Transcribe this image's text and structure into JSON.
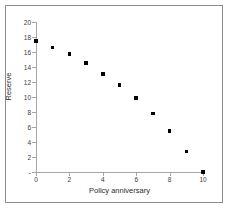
{
  "chart_data": {
    "type": "scatter",
    "title": "",
    "xlabel": "Policy anniversary",
    "ylabel": "Reserve",
    "xlim": [
      0,
      10
    ],
    "ylim": [
      0,
      20
    ],
    "xticks": [
      0,
      2,
      4,
      6,
      8,
      10
    ],
    "xticklabels": [
      "0",
      "2",
      "4",
      "6",
      "8",
      "10"
    ],
    "yticks": [
      0,
      2,
      4,
      6,
      8,
      10,
      12,
      14,
      16,
      18,
      20
    ],
    "yticklabels": [
      "-",
      "2",
      "4",
      "6",
      "8",
      "10",
      "12",
      "14",
      "16",
      "18",
      "20"
    ],
    "grid": false,
    "legend": false,
    "marker": "square",
    "marker_color": "#000000",
    "x": [
      0,
      1,
      2,
      3,
      4,
      5,
      6,
      7,
      8,
      9,
      10
    ],
    "values": [
      17.5,
      16.6,
      15.7,
      14.5,
      13.1,
      11.6,
      9.85,
      7.8,
      5.45,
      2.75,
      0.0
    ],
    "series": [
      {
        "name": "Reserve",
        "x": [
          0,
          1,
          2,
          3,
          4,
          5,
          6,
          7,
          8,
          9,
          10
        ],
        "values": [
          17.5,
          16.6,
          15.7,
          14.5,
          13.1,
          11.6,
          9.85,
          7.8,
          5.45,
          2.75,
          0.0
        ]
      }
    ]
  },
  "colors": {
    "frame": "#8c8c8c",
    "axis": "#a6a6a6",
    "marker": "#000000",
    "text": "#2b2b2b",
    "background": "#ffffff"
  }
}
